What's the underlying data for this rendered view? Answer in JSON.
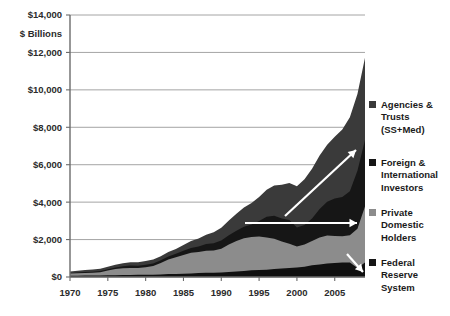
{
  "chart_data": {
    "type": "area",
    "title": "",
    "subtitle": "",
    "xlabel": "",
    "ylabel": "$ Billions",
    "unit_label": "$ Billions",
    "stacked": true,
    "grid": true,
    "legend_position": "right",
    "xlim": [
      1970,
      2009
    ],
    "ylim": [
      0,
      14000
    ],
    "ytick_labels": [
      "$14,000",
      "$12,000",
      "$10,000",
      "$8,000",
      "$6,000",
      "$4,000",
      "$2,000",
      "$0"
    ],
    "ytick_values": [
      14000,
      12000,
      10000,
      8000,
      6000,
      4000,
      2000,
      0
    ],
    "xtick_labels": [
      "1970",
      "1975",
      "1980",
      "1985",
      "1990",
      "1995",
      "2000",
      "2005"
    ],
    "xtick_values": [
      1970,
      1975,
      1980,
      1985,
      1990,
      1995,
      2000,
      2005
    ],
    "x": [
      1970,
      1971,
      1972,
      1973,
      1974,
      1975,
      1976,
      1977,
      1978,
      1979,
      1980,
      1981,
      1982,
      1983,
      1984,
      1985,
      1986,
      1987,
      1988,
      1989,
      1990,
      1991,
      1992,
      1993,
      1994,
      1995,
      1996,
      1997,
      1998,
      1999,
      2000,
      2001,
      2002,
      2003,
      2004,
      2005,
      2006,
      2007,
      2008,
      2009
    ],
    "series": [
      {
        "name": "Federal Reserve System",
        "color": "#101010",
        "stack_order": 1,
        "values": [
          62,
          70,
          75,
          80,
          85,
          90,
          97,
          105,
          110,
          117,
          121,
          124,
          134,
          155,
          160,
          170,
          190,
          212,
          230,
          233,
          235,
          273,
          297,
          326,
          355,
          374,
          391,
          431,
          452,
          478,
          512,
          552,
          629,
          666,
          718,
          744,
          779,
          780,
          476,
          770
        ]
      },
      {
        "name": "Private Domestic Holders",
        "color": "#8c8c8c",
        "stack_order": 2,
        "values": [
          120,
          135,
          140,
          145,
          170,
          255,
          330,
          360,
          370,
          360,
          400,
          460,
          610,
          780,
          900,
          1010,
          1100,
          1120,
          1170,
          1180,
          1270,
          1460,
          1630,
          1740,
          1780,
          1790,
          1720,
          1610,
          1450,
          1300,
          1120,
          1180,
          1300,
          1450,
          1500,
          1450,
          1400,
          1450,
          2100,
          3000
        ]
      },
      {
        "name": "Foreign & International Investors",
        "color": "#161616",
        "stack_order": 3,
        "values": [
          20,
          35,
          50,
          57,
          62,
          67,
          78,
          109,
          137,
          124,
          129,
          136,
          150,
          166,
          176,
          225,
          266,
          300,
          362,
          395,
          441,
          492,
          549,
          619,
          667,
          835,
          1102,
          1231,
          1224,
          1269,
          1016,
          1040,
          1200,
          1520,
          1800,
          2000,
          2100,
          2350,
          3100,
          3550
        ]
      },
      {
        "name": "Agencies & Trusts (SS+Med)",
        "color": "#3a3a3a",
        "stack_order": 4,
        "values": [
          95,
          100,
          110,
          120,
          130,
          140,
          150,
          160,
          170,
          185,
          200,
          210,
          220,
          240,
          265,
          310,
          370,
          430,
          500,
          580,
          680,
          790,
          910,
          1030,
          1150,
          1280,
          1450,
          1620,
          1800,
          1980,
          2200,
          2450,
          2650,
          2850,
          3050,
          3300,
          3600,
          3950,
          4100,
          4400
        ]
      }
    ],
    "legend": [
      {
        "label_lines": [
          "Agencies &",
          "Trusts",
          "(SS+Med)"
        ],
        "color": "#3a3a3a"
      },
      {
        "label_lines": [
          "Foreign &",
          "International",
          "Investors"
        ],
        "color": "#161616"
      },
      {
        "label_lines": [
          "Private",
          "Domestic",
          "Holders"
        ],
        "color": "#8c8c8c"
      },
      {
        "label_lines": [
          "Federal",
          "Reserve",
          "System"
        ],
        "color": "#161616"
      }
    ],
    "annotations": [
      {
        "name": "foreign-growth-arrow",
        "type": "arrow",
        "direction": "up-right",
        "color": "#ffffff"
      },
      {
        "name": "private-flat-arrow",
        "type": "arrow",
        "direction": "right",
        "color": "#ffffff"
      },
      {
        "name": "fed-reserve-arrow",
        "type": "arrow",
        "direction": "down-right",
        "color": "#ffffff"
      }
    ]
  },
  "axis": {
    "unit_label": "$ Billions"
  }
}
